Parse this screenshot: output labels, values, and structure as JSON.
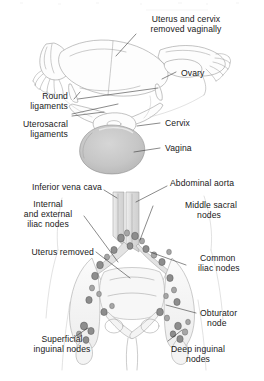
{
  "figure": {
    "background_color": "#ffffff",
    "ink_color": "#202020",
    "panels": [
      {
        "id": "upper",
        "name": "excised-uterus-specimen",
        "description": "Excised uterus, cervix, fallopian tubes, ovaries and vaginal cuff viewed from above"
      },
      {
        "id": "lower",
        "name": "pelvic-lymph-node-map",
        "description": "Anterior pelvis after hysterectomy showing great vessels and lymph node groups"
      }
    ],
    "labels": {
      "uterus_cervix_removed": {
        "line1": "Uterus and cervix",
        "line2": "removed vaginally"
      },
      "ovary": {
        "line1": "Ovary"
      },
      "round_ligaments": {
        "line1": "Round",
        "line2": "ligaments"
      },
      "uterosacral_ligaments": {
        "line1": "Uterosacral",
        "line2": "ligaments"
      },
      "cervix": {
        "line1": "Cervix"
      },
      "vagina": {
        "line1": "Vagina"
      },
      "inferior_vena_cava": {
        "line1": "Inferior vena cava"
      },
      "abdominal_aorta": {
        "line1": "Abdominal aorta"
      },
      "internal_external_iliac_nodes": {
        "line1": "Internal",
        "line2": "and external",
        "line3": "iliac nodes"
      },
      "middle_sacral_nodes": {
        "line1": "Middle sacral",
        "line2": "nodes"
      },
      "uterus_removed": {
        "line1": "Uterus removed"
      },
      "common_iliac_nodes": {
        "line1": "Common",
        "line2": "iliac nodes"
      },
      "obturator_node": {
        "line1": "Obturator",
        "line2": "node"
      },
      "superficial_inguinal_nodes": {
        "line1": "Superficial",
        "line2": "inguinal nodes"
      },
      "deep_inguinal_nodes": {
        "line1": "Deep inguinal",
        "line2": "nodes"
      }
    },
    "colors": {
      "vagina_fill": "#c8c8c8",
      "vessel_fill": "#e3e3e3",
      "bone_fill": "#f4f4f4",
      "lymph_node_fill": "#8d8d8d",
      "organ_outline": "#9a9a9a"
    }
  }
}
